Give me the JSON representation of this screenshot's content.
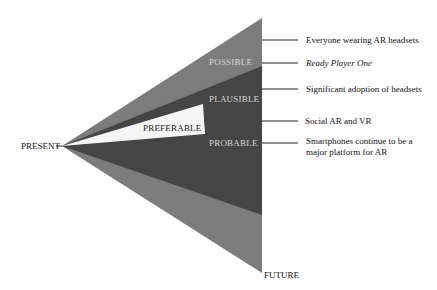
{
  "diagram": {
    "type": "futures-cone",
    "origin_label": "PRESENT",
    "end_label": "FUTURE",
    "cones": [
      {
        "name": "possible",
        "label": "POSSIBLE",
        "color": "#7a7a7a"
      },
      {
        "name": "plausible",
        "label": "PLAUSIBLE",
        "color": "#4a4a4a"
      },
      {
        "name": "probable",
        "label": "PROBABLE",
        "color": "#3a3a3a"
      },
      {
        "name": "preferable",
        "label": "PREFERABLE",
        "color": "#f4f4f4"
      }
    ],
    "annotations": [
      {
        "text": "Everyone wearing AR headsets",
        "italic": false
      },
      {
        "text": "Ready Player One",
        "italic": true
      },
      {
        "text": "Significant adoption of headsets",
        "italic": false
      },
      {
        "text": "Social AR and VR",
        "italic": false
      },
      {
        "text": "Smartphones continue to be a",
        "italic": false
      },
      {
        "text": "major platform for AR",
        "italic": false
      }
    ]
  }
}
